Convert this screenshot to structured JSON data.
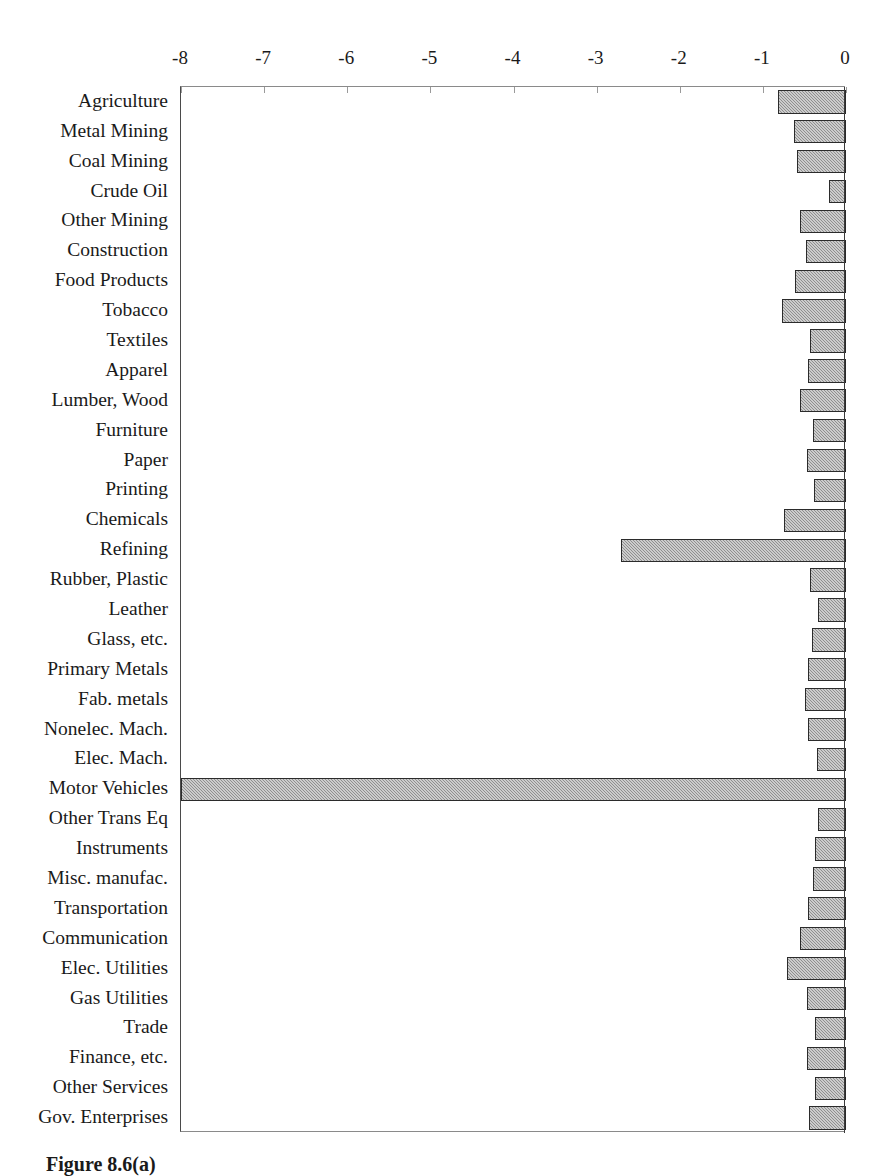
{
  "caption": "Figure 8.6(a)",
  "chart_data": {
    "type": "bar",
    "orientation": "horizontal",
    "title": "",
    "subtitle": "",
    "xlabel": "",
    "ylabel": "",
    "xlim": [
      -8,
      0
    ],
    "xticks": [
      -8,
      -7,
      -6,
      -5,
      -4,
      -3,
      -2,
      -1,
      0
    ],
    "xticklabels": [
      "-8",
      "-7",
      "-6",
      "-5",
      "-4",
      "-3",
      "-2",
      "-1",
      "0"
    ],
    "grid": false,
    "legend": false,
    "legend_position": "none",
    "bar_fill_color": "#8f8f8f",
    "bar_edge_color": "#2b2b2b",
    "axis_color": "#4a4a4a",
    "background_color": "#ffffff",
    "categories": [
      "Agriculture",
      "Metal Mining",
      "Coal Mining",
      "Crude Oil",
      "Other Mining",
      "Construction",
      "Food Products",
      "Tobacco",
      "Textiles",
      "Apparel",
      "Lumber, Wood",
      "Furniture",
      "Paper",
      "Printing",
      "Chemicals",
      "Refining",
      "Rubber, Plastic",
      "Leather",
      "Glass, etc.",
      "Primary Metals",
      "Fab. metals",
      "Nonelec. Mach.",
      "Elec. Mach.",
      "Motor Vehicles",
      "Other Trans Eq",
      "Instruments",
      "Misc. manufac.",
      "Transportation",
      "Communication",
      "Elec. Utilities",
      "Gas Utilities",
      "Trade",
      "Finance, etc.",
      "Other Services",
      "Gov. Enterprises"
    ],
    "values": [
      -0.82,
      -0.63,
      -0.59,
      -0.21,
      -0.55,
      -0.48,
      -0.61,
      -0.77,
      -0.43,
      -0.46,
      -0.55,
      -0.4,
      -0.47,
      -0.39,
      -0.74,
      -2.71,
      -0.43,
      -0.34,
      -0.41,
      -0.46,
      -0.49,
      -0.46,
      -0.35,
      -8.0,
      -0.34,
      -0.37,
      -0.4,
      -0.46,
      -0.55,
      -0.71,
      -0.47,
      -0.37,
      -0.47,
      -0.37,
      -0.44
    ]
  }
}
